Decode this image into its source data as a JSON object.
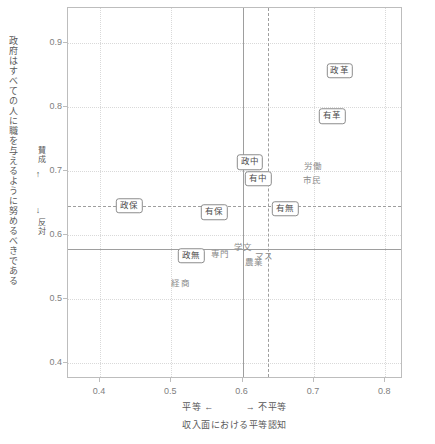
{
  "chart_data": {
    "type": "scatter",
    "title": "",
    "xlabel": "収入面における平等認知",
    "ylabel": "政府はすべての人に職を与えるように努めるべきである",
    "xlim": [
      0.355,
      0.825
    ],
    "ylim": [
      0.375,
      0.955
    ],
    "xticks": [
      "0.4",
      "0.5",
      "0.6",
      "0.7",
      "0.8"
    ],
    "xtick_values": [
      0.4,
      0.5,
      0.6,
      0.7,
      0.8
    ],
    "yticks": [
      "0.4",
      "0.5",
      "0.6",
      "0.7",
      "0.8",
      "0.9"
    ],
    "ytick_values": [
      0.4,
      0.5,
      0.6,
      0.7,
      0.8,
      0.9
    ],
    "grid": "dotted",
    "legend": "none",
    "x_direction_left": "平等",
    "x_direction_left_arrow": "←",
    "x_direction_right_arrow": "→",
    "x_direction_right": "不平等",
    "y_direction_high": "賛成",
    "y_direction_high_arrow": "↑",
    "y_direction_low_arrow": "↓",
    "y_direction_low": "反対",
    "reference_lines": [
      {
        "name": "x-mean-solid",
        "axis": "x",
        "value": 0.6,
        "style": "solid"
      },
      {
        "name": "x-ref-dashed",
        "axis": "x",
        "value": 0.636,
        "style": "dashed"
      },
      {
        "name": "y-mean-solid",
        "axis": "y",
        "value": 0.578,
        "style": "solid"
      },
      {
        "name": "y-ref-dashed",
        "axis": "y",
        "value": 0.646,
        "style": "dashed"
      }
    ],
    "points": [
      {
        "label": "政保",
        "x": 0.441,
        "y": 0.646,
        "style": "boxed"
      },
      {
        "label": "政革",
        "x": 0.736,
        "y": 0.857,
        "style": "boxed"
      },
      {
        "label": "有革",
        "x": 0.726,
        "y": 0.786,
        "style": "boxed"
      },
      {
        "label": "政中",
        "x": 0.61,
        "y": 0.714,
        "style": "boxed"
      },
      {
        "label": "有中",
        "x": 0.622,
        "y": 0.688,
        "style": "boxed"
      },
      {
        "label": "有保",
        "x": 0.56,
        "y": 0.636,
        "style": "boxed"
      },
      {
        "label": "有無",
        "x": 0.66,
        "y": 0.641,
        "style": "boxed"
      },
      {
        "label": "政無",
        "x": 0.528,
        "y": 0.568,
        "style": "boxed"
      },
      {
        "label": "労働",
        "x": 0.699,
        "y": 0.708,
        "style": "plain"
      },
      {
        "label": "市民",
        "x": 0.697,
        "y": 0.686,
        "style": "plain"
      },
      {
        "label": "専門",
        "x": 0.568,
        "y": 0.57,
        "style": "plain"
      },
      {
        "label": "学文",
        "x": 0.601,
        "y": 0.581,
        "style": "plain"
      },
      {
        "label": "マス",
        "x": 0.63,
        "y": 0.567,
        "style": "plain"
      },
      {
        "label": "農業",
        "x": 0.616,
        "y": 0.558,
        "style": "plain"
      },
      {
        "label": "経商",
        "x": 0.513,
        "y": 0.525,
        "style": "plain"
      }
    ]
  }
}
